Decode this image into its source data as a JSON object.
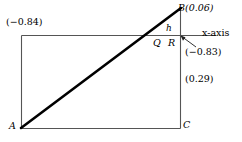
{
  "figure": {
    "background_color": "#ffffff",
    "stroke_color": "#000000",
    "thin_stroke_color": "#4d4d4d",
    "labels": {
      "vertex_b": "B(0.06)",
      "value_top_left": "(−0.84)",
      "height_h": "h",
      "axis_name": "x-axis",
      "point_q": "Q",
      "point_r": "R",
      "value_r": "(−0.83)",
      "value_c_side": "(0.29)",
      "vertex_a": "A",
      "vertex_c": "C"
    },
    "values": {
      "b": 0.06,
      "top_left": -0.84,
      "r": -0.83,
      "right_side": 0.29
    },
    "geometry": {
      "rect_left": 21,
      "rect_top": 35,
      "rect_right": 180,
      "rect_bottom": 128,
      "axis_x_start": 21,
      "axis_x_end": 216,
      "axis_y": 35,
      "point_a": [
        21,
        128
      ],
      "point_b": [
        180,
        9
      ],
      "point_c": [
        180,
        128
      ],
      "point_q": [
        158,
        35
      ],
      "point_r": [
        180,
        35
      ],
      "leader_from": [
        181,
        36
      ],
      "leader_to": [
        196,
        47
      ]
    }
  }
}
